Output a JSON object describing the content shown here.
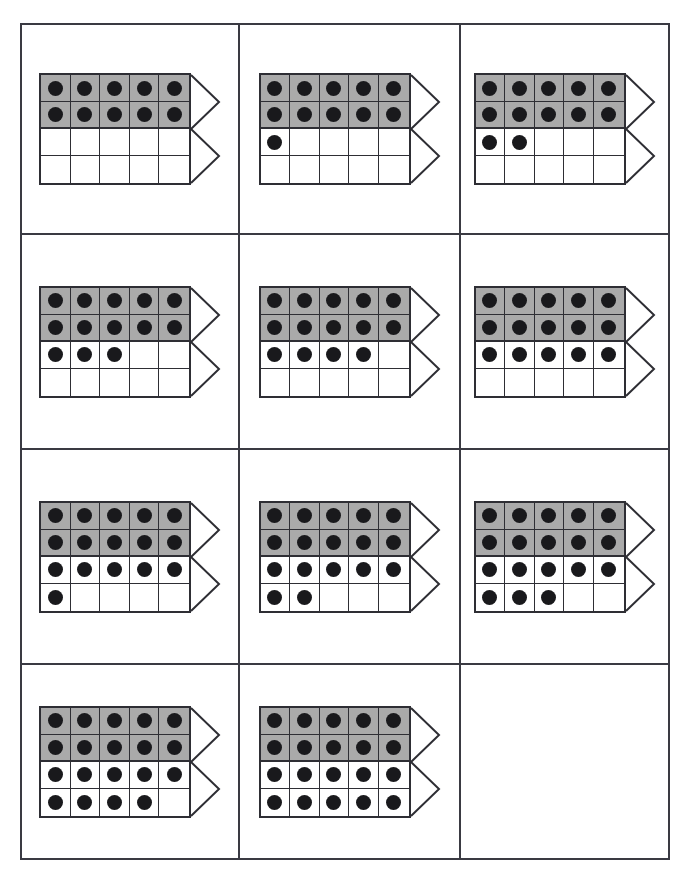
{
  "worksheet": {
    "title": "Twenty Frame Counting Worksheet",
    "grid_columns": 3,
    "grid_rows": 4,
    "frame_columns": 5,
    "frame_rows": 4,
    "shaded_rows": 2,
    "colors": {
      "shaded_cell": "#aaaaaa",
      "dot": "#19191c",
      "line": "#2e2e34",
      "panel_border": "#3a3a42",
      "background": "#ffffff"
    },
    "arrow_label": "chevron-arrow-right"
  },
  "panels": [
    {
      "id": "panel-1",
      "count": 10,
      "empty": false,
      "row_counts": [
        5,
        5,
        0,
        0
      ]
    },
    {
      "id": "panel-2",
      "count": 11,
      "empty": false,
      "row_counts": [
        5,
        5,
        1,
        0
      ]
    },
    {
      "id": "panel-3",
      "count": 12,
      "empty": false,
      "row_counts": [
        5,
        5,
        2,
        0
      ]
    },
    {
      "id": "panel-4",
      "count": 13,
      "empty": false,
      "row_counts": [
        5,
        5,
        3,
        0
      ]
    },
    {
      "id": "panel-5",
      "count": 14,
      "empty": false,
      "row_counts": [
        5,
        5,
        4,
        0
      ]
    },
    {
      "id": "panel-6",
      "count": 15,
      "empty": false,
      "row_counts": [
        5,
        5,
        5,
        0
      ]
    },
    {
      "id": "panel-7",
      "count": 16,
      "empty": false,
      "row_counts": [
        5,
        5,
        5,
        1
      ]
    },
    {
      "id": "panel-8",
      "count": 17,
      "empty": false,
      "row_counts": [
        5,
        5,
        5,
        2
      ]
    },
    {
      "id": "panel-9",
      "count": 18,
      "empty": false,
      "row_counts": [
        5,
        5,
        5,
        3
      ]
    },
    {
      "id": "panel-10",
      "count": 19,
      "empty": false,
      "row_counts": [
        5,
        5,
        5,
        4
      ]
    },
    {
      "id": "panel-11",
      "count": 20,
      "empty": false,
      "row_counts": [
        5,
        5,
        5,
        5
      ]
    },
    {
      "id": "panel-12",
      "count": 0,
      "empty": true,
      "row_counts": [
        0,
        0,
        0,
        0
      ]
    }
  ]
}
